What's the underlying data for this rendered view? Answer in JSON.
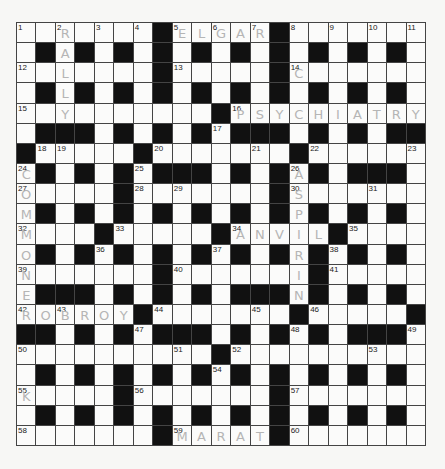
{
  "puzzle": {
    "rows": 21,
    "cols": 21,
    "layout": [
      ".......#.....#.......",
      ".#.#.#.#.#.#.#.#.#.#.",
      ".......#.....#.......",
      ".#.#.#.#.#.#.#.#.#.#.",
      "..........#..........",
      ".###.#.#.#.###.#.#.##",
      "#.....#.......#......",
      ".#.#.#.###.#.#.#.###.",
      ".....#.......#.......",
      ".#.#.#.#.#.#.#.#.#.#.",
      "....#.....#.....#....",
      ".#.#.#.#.#.#.#.#.#.#.",
      ".......#.......#.....",
      ".###.#.#.#.###.#.#.#.",
      "......#.......#.....#",
      "##.#.#.###.#.#.#.###.",
      "..........#..........",
      ".#.#.#.#.#.#.#.#.#.#.",
      ".....#.......#.......",
      ".#.#.#.#.#.#.#.#.#.#.",
      ".......#.....#......."
    ],
    "numbers": [
      {
        "r": 0,
        "c": 0,
        "n": "1"
      },
      {
        "r": 0,
        "c": 2,
        "n": "2"
      },
      {
        "r": 0,
        "c": 4,
        "n": "3"
      },
      {
        "r": 0,
        "c": 6,
        "n": "4"
      },
      {
        "r": 0,
        "c": 8,
        "n": "5"
      },
      {
        "r": 0,
        "c": 10,
        "n": "6"
      },
      {
        "r": 0,
        "c": 12,
        "n": "7"
      },
      {
        "r": 0,
        "c": 14,
        "n": "8"
      },
      {
        "r": 0,
        "c": 16,
        "n": "9"
      },
      {
        "r": 0,
        "c": 18,
        "n": "10"
      },
      {
        "r": 0,
        "c": 20,
        "n": "11"
      },
      {
        "r": 2,
        "c": 0,
        "n": "12"
      },
      {
        "r": 2,
        "c": 8,
        "n": "13"
      },
      {
        "r": 2,
        "c": 14,
        "n": "14"
      },
      {
        "r": 4,
        "c": 0,
        "n": "15"
      },
      {
        "r": 4,
        "c": 11,
        "n": "16"
      },
      {
        "r": 5,
        "c": 10,
        "n": "17"
      },
      {
        "r": 6,
        "c": 1,
        "n": "18"
      },
      {
        "r": 6,
        "c": 2,
        "n": "19"
      },
      {
        "r": 6,
        "c": 7,
        "n": "20"
      },
      {
        "r": 6,
        "c": 12,
        "n": "21"
      },
      {
        "r": 6,
        "c": 15,
        "n": "22"
      },
      {
        "r": 6,
        "c": 20,
        "n": "23"
      },
      {
        "r": 7,
        "c": 0,
        "n": "24"
      },
      {
        "r": 7,
        "c": 6,
        "n": "25"
      },
      {
        "r": 7,
        "c": 14,
        "n": "26"
      },
      {
        "r": 8,
        "c": 0,
        "n": "27"
      },
      {
        "r": 8,
        "c": 6,
        "n": "28"
      },
      {
        "r": 8,
        "c": 8,
        "n": "29"
      },
      {
        "r": 8,
        "c": 14,
        "n": "30"
      },
      {
        "r": 8,
        "c": 18,
        "n": "31"
      },
      {
        "r": 10,
        "c": 0,
        "n": "32"
      },
      {
        "r": 10,
        "c": 5,
        "n": "33"
      },
      {
        "r": 10,
        "c": 11,
        "n": "34"
      },
      {
        "r": 10,
        "c": 17,
        "n": "35"
      },
      {
        "r": 11,
        "c": 4,
        "n": "36"
      },
      {
        "r": 11,
        "c": 10,
        "n": "37"
      },
      {
        "r": 11,
        "c": 16,
        "n": "38"
      },
      {
        "r": 12,
        "c": 0,
        "n": "39"
      },
      {
        "r": 12,
        "c": 8,
        "n": "40"
      },
      {
        "r": 12,
        "c": 16,
        "n": "41"
      },
      {
        "r": 14,
        "c": 0,
        "n": "42"
      },
      {
        "r": 14,
        "c": 2,
        "n": "43"
      },
      {
        "r": 14,
        "c": 7,
        "n": "44"
      },
      {
        "r": 14,
        "c": 12,
        "n": "45"
      },
      {
        "r": 14,
        "c": 15,
        "n": "46"
      },
      {
        "r": 15,
        "c": 6,
        "n": "47"
      },
      {
        "r": 15,
        "c": 14,
        "n": "48"
      },
      {
        "r": 15,
        "c": 20,
        "n": "49"
      },
      {
        "r": 16,
        "c": 0,
        "n": "50"
      },
      {
        "r": 16,
        "c": 8,
        "n": "51"
      },
      {
        "r": 16,
        "c": 11,
        "n": "52"
      },
      {
        "r": 16,
        "c": 18,
        "n": "53"
      },
      {
        "r": 17,
        "c": 10,
        "n": "54"
      },
      {
        "r": 18,
        "c": 0,
        "n": "55"
      },
      {
        "r": 18,
        "c": 6,
        "n": "56"
      },
      {
        "r": 18,
        "c": 14,
        "n": "57"
      },
      {
        "r": 20,
        "c": 0,
        "n": "58"
      },
      {
        "r": 20,
        "c": 8,
        "n": "59"
      },
      {
        "r": 20,
        "c": 14,
        "n": "60"
      }
    ],
    "entries": [
      {
        "r": 0,
        "c": 2,
        "l": "R"
      },
      {
        "r": 1,
        "c": 2,
        "l": "A"
      },
      {
        "r": 2,
        "c": 2,
        "l": "L"
      },
      {
        "r": 3,
        "c": 2,
        "l": "L"
      },
      {
        "r": 4,
        "c": 2,
        "l": "Y"
      },
      {
        "r": 0,
        "c": 8,
        "l": "E"
      },
      {
        "r": 0,
        "c": 9,
        "l": "L"
      },
      {
        "r": 0,
        "c": 10,
        "l": "G"
      },
      {
        "r": 0,
        "c": 11,
        "l": "A"
      },
      {
        "r": 0,
        "c": 12,
        "l": "R"
      },
      {
        "r": 2,
        "c": 14,
        "l": "C"
      },
      {
        "r": 4,
        "c": 11,
        "l": "P"
      },
      {
        "r": 4,
        "c": 12,
        "l": "S"
      },
      {
        "r": 4,
        "c": 13,
        "l": "Y"
      },
      {
        "r": 4,
        "c": 14,
        "l": "C"
      },
      {
        "r": 4,
        "c": 15,
        "l": "H"
      },
      {
        "r": 4,
        "c": 16,
        "l": "I"
      },
      {
        "r": 4,
        "c": 17,
        "l": "A"
      },
      {
        "r": 4,
        "c": 18,
        "l": "T"
      },
      {
        "r": 4,
        "c": 19,
        "l": "R"
      },
      {
        "r": 4,
        "c": 20,
        "l": "Y"
      },
      {
        "r": 7,
        "c": 0,
        "l": "C"
      },
      {
        "r": 8,
        "c": 0,
        "l": "O"
      },
      {
        "r": 9,
        "c": 0,
        "l": "M"
      },
      {
        "r": 10,
        "c": 0,
        "l": "M"
      },
      {
        "r": 11,
        "c": 0,
        "l": "O"
      },
      {
        "r": 12,
        "c": 0,
        "l": "N"
      },
      {
        "r": 13,
        "c": 0,
        "l": "E"
      },
      {
        "r": 14,
        "c": 0,
        "l": "R"
      },
      {
        "r": 14,
        "c": 1,
        "l": "O"
      },
      {
        "r": 14,
        "c": 2,
        "l": "B"
      },
      {
        "r": 14,
        "c": 3,
        "l": "R"
      },
      {
        "r": 14,
        "c": 4,
        "l": "O"
      },
      {
        "r": 14,
        "c": 5,
        "l": "Y"
      },
      {
        "r": 7,
        "c": 14,
        "l": "A"
      },
      {
        "r": 8,
        "c": 14,
        "l": "S"
      },
      {
        "r": 9,
        "c": 14,
        "l": "P"
      },
      {
        "r": 10,
        "c": 14,
        "l": "I"
      },
      {
        "r": 11,
        "c": 14,
        "l": "R"
      },
      {
        "r": 12,
        "c": 14,
        "l": "I"
      },
      {
        "r": 13,
        "c": 14,
        "l": "N"
      },
      {
        "r": 10,
        "c": 11,
        "l": "A"
      },
      {
        "r": 10,
        "c": 12,
        "l": "N"
      },
      {
        "r": 10,
        "c": 13,
        "l": "V"
      },
      {
        "r": 10,
        "c": 15,
        "l": "L"
      },
      {
        "r": 18,
        "c": 0,
        "l": "K"
      },
      {
        "r": 20,
        "c": 8,
        "l": "M"
      },
      {
        "r": 20,
        "c": 9,
        "l": "A"
      },
      {
        "r": 20,
        "c": 10,
        "l": "R"
      },
      {
        "r": 20,
        "c": 11,
        "l": "A"
      },
      {
        "r": 20,
        "c": 12,
        "l": "T"
      }
    ]
  }
}
